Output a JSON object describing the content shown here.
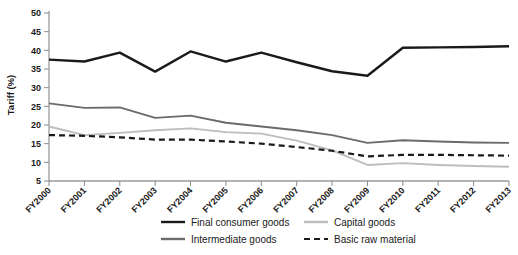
{
  "chart_data": {
    "type": "line",
    "title": "",
    "xlabel": "",
    "ylabel": "Tariff (%)",
    "ylim": [
      5,
      50
    ],
    "ytick_step": 5,
    "grid": false,
    "legend_position": "bottom",
    "categories": [
      "FY2000",
      "FY2001",
      "FY2002",
      "FY2003",
      "FY2004",
      "FY2005",
      "FY2006",
      "FY2007",
      "FY2008",
      "FY2009",
      "FY2010",
      "FY2011",
      "FY2012",
      "FY2013"
    ],
    "yticks": [
      5,
      10,
      15,
      20,
      25,
      30,
      35,
      40,
      45,
      50
    ],
    "series": [
      {
        "name": "Final consumer goods",
        "color": "#1a1a1a",
        "style": "solid",
        "width": 2.4,
        "values": [
          37.5,
          37.0,
          39.4,
          34.3,
          39.7,
          37.0,
          39.4,
          36.8,
          34.4,
          33.2,
          40.7,
          40.8,
          40.9,
          41.1
        ]
      },
      {
        "name": "Intermediate goods",
        "color": "#6b6b6b",
        "style": "solid",
        "width": 1.9,
        "values": [
          25.8,
          24.6,
          24.7,
          21.9,
          22.5,
          20.6,
          19.6,
          18.6,
          17.3,
          15.2,
          15.9,
          15.6,
          15.3,
          15.2
        ]
      },
      {
        "name": "Capital goods",
        "color": "#bdbdbd",
        "style": "solid",
        "width": 1.9,
        "values": [
          19.6,
          17.3,
          17.9,
          18.6,
          19.1,
          18.1,
          17.7,
          15.8,
          13.2,
          9.3,
          9.8,
          9.3,
          9.0,
          8.8
        ]
      },
      {
        "name": "Basic raw material",
        "color": "#1a1a1a",
        "style": "dashed",
        "width": 2.2,
        "values": [
          17.3,
          17.1,
          16.7,
          16.1,
          16.1,
          15.6,
          15.0,
          14.1,
          13.1,
          11.6,
          12.0,
          12.0,
          11.9,
          11.8
        ]
      }
    ],
    "legend": [
      {
        "label": "Final consumer goods",
        "color": "#1a1a1a",
        "style": "solid"
      },
      {
        "label": "Capital goods",
        "color": "#bdbdbd",
        "style": "solid"
      },
      {
        "label": "Intermediate goods",
        "color": "#6b6b6b",
        "style": "solid"
      },
      {
        "label": "Basic raw material",
        "color": "#1a1a1a",
        "style": "dashed"
      }
    ]
  }
}
